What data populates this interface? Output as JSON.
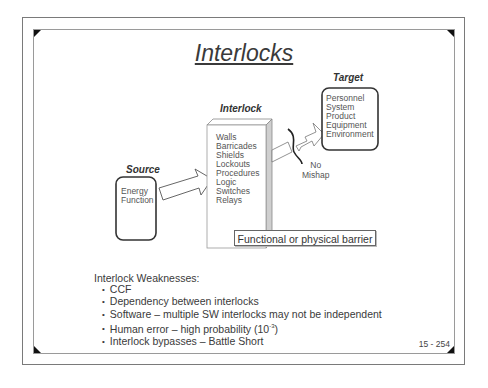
{
  "slide": {
    "title": "Interlocks",
    "page_number": "15 - 254"
  },
  "diagram": {
    "source": {
      "label": "Source",
      "items": [
        "Energy",
        "Function"
      ]
    },
    "interlock": {
      "label": "Interlock",
      "items": [
        "Walls",
        "Barricades",
        "Shields",
        "Lockouts",
        "Procedures",
        "Logic",
        "Switches",
        "Relays"
      ]
    },
    "target": {
      "label": "Target",
      "items": [
        "Personnel",
        "System",
        "Product",
        "Equipment",
        "Environment"
      ]
    },
    "outcome": {
      "line1": "No",
      "line2": "Mishap"
    },
    "barrier_caption": "Functional or physical barrier"
  },
  "weaknesses": {
    "heading": "Interlock Weaknesses:",
    "items": [
      "CCF",
      "Dependency between interlocks",
      "Software – multiple SW interlocks may not be independent",
      "Human error – high probability (10",
      "Interlock bypasses – Battle Short"
    ],
    "human_error_exponent": "-3",
    "human_error_suffix": ")"
  }
}
